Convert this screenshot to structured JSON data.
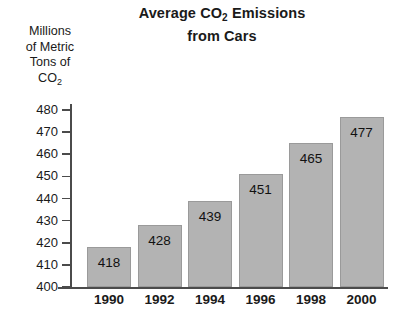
{
  "chart_data": {
    "type": "bar",
    "title": "Average CO2 Emissions from Cars",
    "title_line1_pre": "Average CO",
    "title_line1_sub": "2",
    "title_line1_post": " Emissions",
    "title_line2": "from Cars",
    "ylabel": "Millions of Metric Tons of CO2",
    "ylabel_lines": [
      "Millions",
      "of Metric",
      "Tons of"
    ],
    "ylabel_last_pre": "CO",
    "ylabel_last_sub": "2",
    "xlabel": "",
    "categories": [
      "1990",
      "1992",
      "1994",
      "1996",
      "1998",
      "2000"
    ],
    "values": [
      418,
      428,
      439,
      451,
      465,
      477
    ],
    "value_labels": [
      "418",
      "428",
      "439",
      "451",
      "465",
      "477"
    ],
    "ylim": [
      400,
      480
    ],
    "yticks": [
      480,
      470,
      460,
      450,
      440,
      430,
      420,
      410,
      400
    ],
    "ytick_labels": [
      "480",
      "470",
      "460",
      "450",
      "440",
      "430",
      "420",
      "410",
      "400"
    ],
    "grid": false,
    "legend": false,
    "bar_color": "#b3b3b3",
    "bar_border_color": "#9a9a9a",
    "axis_color": "#4b4b4b",
    "background_color": "#ffffff",
    "text_color": "#1a1a1a"
  }
}
